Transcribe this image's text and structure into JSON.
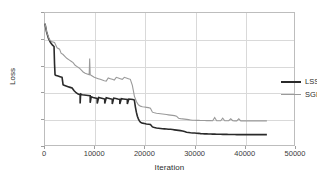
{
  "chart_data": {
    "type": "line",
    "title": "",
    "xlabel": "Iteration",
    "ylabel": "Loss",
    "xlim": [
      0,
      50000
    ],
    "ylim": [
      0,
      10
    ],
    "xticks": [
      0,
      10000,
      20000,
      30000,
      40000,
      50000
    ],
    "xtick_labels": [
      "0",
      "10000",
      "20000",
      "30000",
      "40000",
      "50000"
    ],
    "yticks": [
      0,
      2,
      4,
      6,
      8,
      10
    ],
    "ytick_labels": [
      "0",
      "2",
      "4",
      "6",
      "8",
      "10"
    ],
    "grid": true,
    "legend_position": "center-right-inside",
    "series": [
      {
        "name": "LSSGD",
        "color": "#2a2a2a",
        "linewidth": 1.6,
        "x": [
          0,
          300,
          700,
          1100,
          1500,
          1800,
          1900,
          2000,
          2100,
          2600,
          3000,
          3400,
          3600,
          3800,
          4200,
          4600,
          5000,
          5400,
          5800,
          6200,
          6600,
          7000,
          7000,
          7100,
          7400,
          7800,
          8200,
          8600,
          9000,
          9000,
          9200,
          9600,
          10000,
          10400,
          10400,
          10700,
          11100,
          11500,
          11900,
          11900,
          12200,
          12600,
          13000,
          13400,
          13400,
          13700,
          14100,
          14500,
          14900,
          14900,
          15200,
          15600,
          16000,
          16400,
          16400,
          16700,
          17100,
          17500,
          17800,
          18000,
          18200,
          18400,
          18600,
          18800,
          19000,
          19200,
          19400,
          19800,
          20200,
          20600,
          21000,
          21400,
          21800,
          22200,
          22600,
          23000,
          23400,
          23800,
          24200,
          24600,
          25000,
          25400,
          25800,
          26200,
          26600,
          27000,
          27400,
          27800,
          28200,
          28600,
          29000,
          29400,
          29800,
          30200,
          30600,
          31000,
          31400,
          31800,
          32200,
          32600,
          33000,
          33400,
          33800,
          34200,
          34600,
          35000,
          35400,
          35800,
          36200,
          36600,
          37000,
          37400,
          37800,
          38200,
          38600,
          39000,
          39400,
          39800,
          40200,
          40600,
          41000,
          41400,
          41800,
          42200,
          42600,
          43000,
          43400,
          43800,
          44200
        ],
        "y": [
          9.2,
          8.6,
          8.1,
          7.8,
          7.6,
          7.5,
          6.2,
          5.4,
          5.35,
          5.3,
          5.25,
          5.2,
          4.65,
          4.6,
          4.55,
          4.5,
          4.45,
          4.4,
          4.2,
          4.05,
          3.95,
          3.9,
          3.25,
          3.95,
          3.9,
          3.88,
          3.86,
          3.84,
          3.82,
          3.3,
          3.75,
          3.7,
          3.66,
          3.62,
          3.25,
          3.7,
          3.66,
          3.62,
          3.58,
          3.25,
          3.68,
          3.64,
          3.6,
          3.56,
          3.2,
          3.65,
          3.62,
          3.58,
          3.55,
          3.2,
          3.6,
          3.58,
          3.56,
          3.54,
          3.2,
          3.58,
          3.56,
          3.54,
          3.5,
          3.0,
          2.6,
          2.3,
          2.1,
          1.95,
          1.85,
          1.8,
          1.78,
          1.75,
          1.72,
          1.7,
          1.68,
          1.5,
          1.45,
          1.42,
          1.4,
          1.38,
          1.36,
          1.35,
          1.34,
          1.33,
          1.32,
          1.3,
          1.28,
          1.26,
          1.24,
          1.22,
          1.2,
          1.15,
          1.1,
          1.08,
          1.06,
          1.05,
          1.04,
          1.03,
          1.02,
          1.0,
          0.99,
          0.98,
          0.98,
          0.97,
          0.97,
          0.96,
          0.96,
          0.95,
          0.95,
          0.95,
          0.94,
          0.94,
          0.94,
          0.93,
          0.93,
          0.93,
          0.93,
          0.92,
          0.92,
          0.92,
          0.92,
          0.92,
          0.92,
          0.92,
          0.92,
          0.92,
          0.92,
          0.92,
          0.92,
          0.92,
          0.92,
          0.92,
          0.92
        ]
      },
      {
        "name": "SGD",
        "color": "#9a9a9a",
        "linewidth": 1.1,
        "x": [
          0,
          400,
          900,
          1400,
          1900,
          2400,
          2900,
          3200,
          3600,
          4000,
          4400,
          4800,
          5200,
          5600,
          6000,
          6400,
          6800,
          7200,
          7600,
          8000,
          8400,
          8800,
          8900,
          9000,
          9400,
          9800,
          10200,
          10600,
          11000,
          11400,
          11800,
          12200,
          12600,
          13000,
          13400,
          13800,
          14200,
          14600,
          15000,
          15400,
          15800,
          16200,
          16600,
          17000,
          17400,
          17600,
          17800,
          18200,
          18600,
          19000,
          19400,
          19800,
          20200,
          20600,
          21000,
          21400,
          21800,
          22200,
          22600,
          23000,
          23400,
          23800,
          24200,
          24600,
          25000,
          25400,
          25800,
          26200,
          26600,
          27000,
          27400,
          27800,
          28200,
          28600,
          29000,
          29400,
          29800,
          30200,
          30600,
          31000,
          31400,
          31800,
          32200,
          32600,
          33000,
          33400,
          33800,
          34200,
          34600,
          35000,
          35400,
          35800,
          36200,
          36600,
          37000,
          37400,
          37800,
          38200,
          38600,
          39000,
          39400,
          39800,
          40200,
          40600,
          41000,
          41400,
          41800,
          42200,
          42600,
          43000,
          43400,
          43800,
          44200
        ],
        "y": [
          9.2,
          8.5,
          8.0,
          7.85,
          7.8,
          7.4,
          7.3,
          7.0,
          6.9,
          6.75,
          6.6,
          6.5,
          6.4,
          6.3,
          6.1,
          6.0,
          5.9,
          5.75,
          5.6,
          5.5,
          5.45,
          5.4,
          6.6,
          5.4,
          5.3,
          5.2,
          5.15,
          5.1,
          5.05,
          5.0,
          4.95,
          4.92,
          5.15,
          5.1,
          5.05,
          5.0,
          5.2,
          5.15,
          5.1,
          5.05,
          5.2,
          5.15,
          5.1,
          5.05,
          4.6,
          4.2,
          3.8,
          3.4,
          3.15,
          3.05,
          3.0,
          2.98,
          2.96,
          2.94,
          2.9,
          2.6,
          2.55,
          2.52,
          2.5,
          2.48,
          2.46,
          2.44,
          2.42,
          2.4,
          2.38,
          2.36,
          2.34,
          2.3,
          2.15,
          2.12,
          2.1,
          2.08,
          2.06,
          2.04,
          2.02,
          2.0,
          2.0,
          1.99,
          1.99,
          1.98,
          1.98,
          1.98,
          1.97,
          1.97,
          1.97,
          1.96,
          2.2,
          1.96,
          1.96,
          1.96,
          2.15,
          1.96,
          1.96,
          1.96,
          2.1,
          1.96,
          1.95,
          1.95,
          2.1,
          1.95,
          1.95,
          1.95,
          1.95,
          1.95,
          1.95,
          1.95,
          1.95,
          1.95,
          1.95,
          1.95,
          1.95,
          1.95,
          1.95
        ]
      }
    ]
  },
  "legend": {
    "items": [
      {
        "label": "LSSGD",
        "color": "#2a2a2a"
      },
      {
        "label": "SGD",
        "color": "#9a9a9a"
      }
    ]
  }
}
